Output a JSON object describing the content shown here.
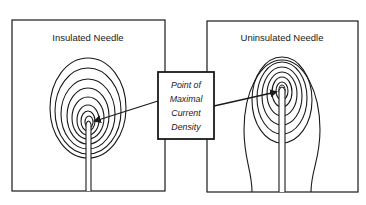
{
  "diagram": {
    "panels": [
      {
        "id": "insulated",
        "title": "Insulated Needle"
      },
      {
        "id": "uninsulated",
        "title": "Uninsulated Needle"
      }
    ],
    "callout": {
      "lines": [
        "Point of",
        "Maximal",
        "Current",
        "Density"
      ]
    },
    "colors": {
      "stroke": "#1a1a1a",
      "background": "#ffffff"
    }
  }
}
